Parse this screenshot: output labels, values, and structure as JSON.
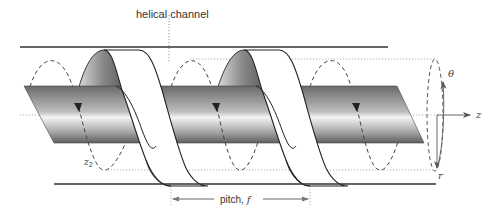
{
  "diagram": {
    "type": "helical-channel-schematic",
    "labels": {
      "helical_channel": "helical channel",
      "pitch": "pitch, ",
      "pitch_symbol": "f",
      "z2": "z",
      "z2_sub": "2",
      "axis_z": "z",
      "axis_r": "r",
      "axis_theta": "θ"
    },
    "colors": {
      "line": "#333333",
      "dotted": "#999999",
      "shaft_dark": "#6e6e6e",
      "shaft_light": "#f2f2f2",
      "flight_fill": "#ffffff",
      "arrow": "#666666"
    },
    "elements": [
      {
        "name": "barrel-top-wall"
      },
      {
        "name": "barrel-bottom-wall"
      },
      {
        "name": "shaft"
      },
      {
        "name": "helical-flight",
        "count": 2
      },
      {
        "name": "streamline-loop",
        "count": 3
      },
      {
        "name": "coordinate-axes",
        "axes": [
          "z",
          "r",
          "θ"
        ]
      },
      {
        "name": "pitch-dimension"
      }
    ]
  }
}
